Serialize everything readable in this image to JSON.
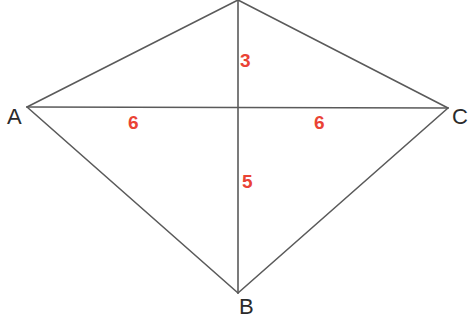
{
  "figure": {
    "type": "geometry-diagram",
    "shape": "kite-quadrilateral-with-diagonals",
    "background_color": "#ffffff",
    "line_color": "#5a5a5a",
    "line_width": 1.6,
    "vertex_label_color": "#2b2b2b",
    "segment_label_color": "#ea4335"
  },
  "vertices": [
    {
      "id": "D",
      "label": "",
      "x": 238,
      "y": 0,
      "labelled": false
    },
    {
      "id": "A",
      "label": "A",
      "x": 27,
      "y": 107,
      "labelled": true
    },
    {
      "id": "B",
      "label": "B",
      "x": 238,
      "y": 293,
      "labelled": true
    },
    {
      "id": "C",
      "label": "C",
      "x": 448,
      "y": 108,
      "labelled": true
    }
  ],
  "intersection": {
    "id": "E",
    "x": 238,
    "y": 108
  },
  "edges": [
    {
      "id": "DA",
      "from": "D",
      "to": "A"
    },
    {
      "id": "DC",
      "from": "D",
      "to": "C"
    },
    {
      "id": "AB",
      "from": "A",
      "to": "B"
    },
    {
      "id": "BC",
      "from": "B",
      "to": "C"
    }
  ],
  "diagonals": [
    {
      "id": "AC",
      "from": "A",
      "to": "C",
      "orientation": "horizontal"
    },
    {
      "id": "DB",
      "from": "D",
      "to": "B",
      "orientation": "vertical"
    }
  ],
  "segment_labels": [
    {
      "id": "top-3",
      "text": "3",
      "segment": "D-E",
      "x": 240,
      "y": 51
    },
    {
      "id": "left-6",
      "text": "6",
      "segment": "A-E",
      "x": 128,
      "y": 113
    },
    {
      "id": "right-6",
      "text": "6",
      "segment": "E-C",
      "x": 314,
      "y": 113
    },
    {
      "id": "bottom-5",
      "text": "5",
      "segment": "E-B",
      "x": 242,
      "y": 172
    }
  ],
  "labels": {
    "A": "A",
    "B": "B",
    "C": "C",
    "top_segment": "3",
    "left_segment": "6",
    "right_segment": "6",
    "bottom_segment": "5"
  }
}
